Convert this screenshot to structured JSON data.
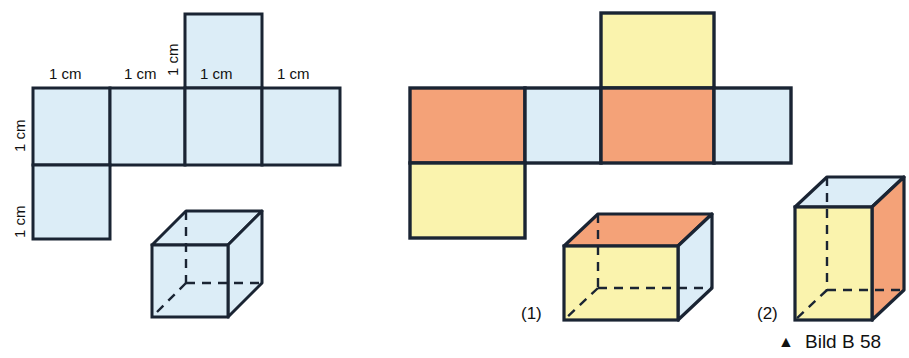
{
  "figure": {
    "caption": {
      "marker": "▲",
      "text": "Bild B 58"
    },
    "colors": {
      "blue": "#dcedf7",
      "orange": "#f4a278",
      "yellow": "#faf3ad",
      "outline": "#1a2433",
      "background": "#ffffff"
    },
    "left_figure": {
      "name": "cube-net-and-cube-blue",
      "dimension_labels": [
        {
          "text": "1 cm",
          "orientation": "horizontal",
          "x": 49,
          "y": 66
        },
        {
          "text": "1 cm",
          "orientation": "horizontal",
          "x": 124,
          "y": 66
        },
        {
          "text": "1 cm",
          "orientation": "horizontal",
          "x": 200,
          "y": 66
        },
        {
          "text": "1 cm",
          "orientation": "horizontal",
          "x": 277,
          "y": 66
        },
        {
          "text": "1 cm",
          "orientation": "vertical",
          "x": 12,
          "y": 152
        },
        {
          "text": "1 cm",
          "orientation": "vertical",
          "x": 12,
          "y": 238
        },
        {
          "text": "1 cm",
          "orientation": "vertical",
          "x": 165,
          "y": 76
        }
      ],
      "net_faces": [
        {
          "name": "net-face-left",
          "color": "blue",
          "x": 33,
          "y": 88,
          "w": 77,
          "h": 77
        },
        {
          "name": "net-face-middle-left",
          "color": "blue",
          "x": 110,
          "y": 88,
          "w": 75,
          "h": 77
        },
        {
          "name": "net-face-middle-right",
          "color": "blue",
          "x": 185,
          "y": 88,
          "w": 77,
          "h": 77
        },
        {
          "name": "net-face-right",
          "color": "blue",
          "x": 262,
          "y": 88,
          "w": 78,
          "h": 77
        },
        {
          "name": "net-face-top",
          "color": "blue",
          "x": 185,
          "y": 14,
          "w": 77,
          "h": 74
        },
        {
          "name": "net-face-bottom",
          "color": "blue",
          "x": 33,
          "y": 165,
          "w": 77,
          "h": 74
        }
      ],
      "solid": {
        "name": "cube-blue",
        "type": "cube",
        "front_face_color": "blue",
        "top_face_color": "blue",
        "right_face_color": "blue"
      }
    },
    "right_figure": {
      "name": "cuboid-net-and-cuboids-colored",
      "net_faces": [
        {
          "name": "net-face-left",
          "color": "orange",
          "x": 410,
          "y": 88,
          "w": 115,
          "h": 75
        },
        {
          "name": "net-face-middle-left",
          "color": "blue",
          "x": 525,
          "y": 88,
          "w": 76,
          "h": 75
        },
        {
          "name": "net-face-middle-right",
          "color": "orange",
          "x": 601,
          "y": 88,
          "w": 113,
          "h": 75
        },
        {
          "name": "net-face-right",
          "color": "blue",
          "x": 714,
          "y": 88,
          "w": 77,
          "h": 75
        },
        {
          "name": "net-face-top",
          "color": "yellow",
          "x": 601,
          "y": 13,
          "w": 113,
          "h": 75
        },
        {
          "name": "net-face-bottom",
          "color": "yellow",
          "x": 410,
          "y": 163,
          "w": 115,
          "h": 75
        }
      ],
      "solids": [
        {
          "name": "cuboid-1",
          "index_label": "(1)",
          "index_x": 521,
          "index_y": 305,
          "front_face_color": "yellow",
          "top_face_color": "orange",
          "right_face_color": "blue"
        },
        {
          "name": "cuboid-2",
          "index_label": "(2)",
          "index_x": 757,
          "index_y": 305,
          "front_face_color": "yellow",
          "top_face_color": "blue",
          "right_face_color": "orange"
        }
      ]
    }
  }
}
